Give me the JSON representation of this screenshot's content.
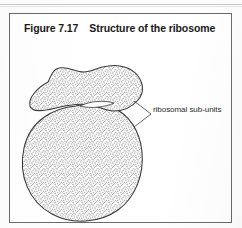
{
  "figure": {
    "number": "Figure 7.17",
    "title": "Structure of the ribosome",
    "caption_full": "Figure 7.17    Structure of the ribosome"
  },
  "diagram": {
    "type": "biological-illustration",
    "subject": "ribosome",
    "fill_style": "stippled-grey",
    "outline_color": "#3a3a3a",
    "stipple_color": "#9a9a9a",
    "parts": [
      {
        "name": "small-subunit",
        "description": "upper bean shaped lobe"
      },
      {
        "name": "large-subunit",
        "description": "lower rounded lobe"
      },
      {
        "name": "subunit-gap",
        "description": "narrow white cleft between the two subunits"
      }
    ],
    "labels": [
      {
        "name": "ribosomal-sub-units",
        "text": "ribosomal sub-units",
        "leader_lines": 2
      }
    ]
  }
}
